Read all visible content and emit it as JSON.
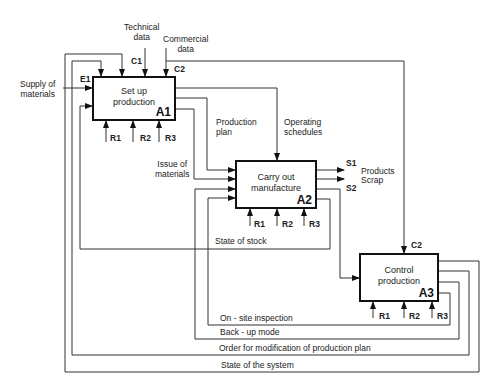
{
  "diagram": {
    "type": "IDEF0",
    "boxes": [
      {
        "id": "A1",
        "title_line1": "Set up",
        "title_line2": "production"
      },
      {
        "id": "A2",
        "title_line1": "Carry out",
        "title_line2": "manufacture"
      },
      {
        "id": "A3",
        "title_line1": "Control",
        "title_line2": "production"
      }
    ],
    "inputs": {
      "supply_line1": "Supply of",
      "supply_line2": "materials",
      "e1": "E1"
    },
    "controls": {
      "technical_line1": "Technical",
      "technical_line2": "data",
      "c1": "C1",
      "commercial_line1": "Commercial",
      "commercial_line2": "data",
      "c2": "C2",
      "c2_a3": "C2"
    },
    "resources": {
      "r1": "R1",
      "r2": "R2",
      "r3": "R3"
    },
    "flows": {
      "production_plan_line1": "Production",
      "production_plan_line2": "plan",
      "operating_line1": "Operating",
      "operating_line2": "schedules",
      "issue_line1": "Issue of",
      "issue_line2": "materials",
      "state_of_stock": "State of stock",
      "on_site": "On - site inspection",
      "backup": "Back - up mode",
      "order_mod": "Order for modification of production plan",
      "state_system": "State of the system"
    },
    "outputs": {
      "s1": "S1",
      "s2": "S2",
      "products": "Products",
      "scrap": "Scrap"
    }
  }
}
